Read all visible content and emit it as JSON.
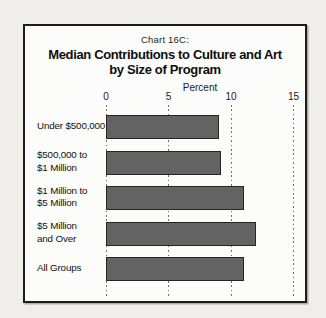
{
  "header": {
    "chart_label": "Chart 16C:",
    "title_line1": "Median Contributions to Culture and Art",
    "title_line2": "by Size of Program",
    "axis_title": "Percent"
  },
  "chart_data": {
    "type": "bar",
    "orientation": "horizontal",
    "title": "Chart 16C: Median Contributions to Culture and Art by Size of Program",
    "xlabel": "Percent",
    "xlim": [
      0,
      15
    ],
    "xticks": [
      0,
      5,
      10,
      15
    ],
    "grid": "vertical-dotted",
    "legend": "none",
    "categories": [
      [
        "Under $500,000"
      ],
      [
        "$500,000 to",
        "$1 Million"
      ],
      [
        "$1 Million to",
        "$5 Million"
      ],
      [
        "$5 Million",
        "and Over"
      ],
      [
        "All Groups"
      ]
    ],
    "values": [
      9,
      9.2,
      11,
      12,
      11
    ],
    "bar_color": "#636363",
    "bar_border_color": "#262626"
  }
}
